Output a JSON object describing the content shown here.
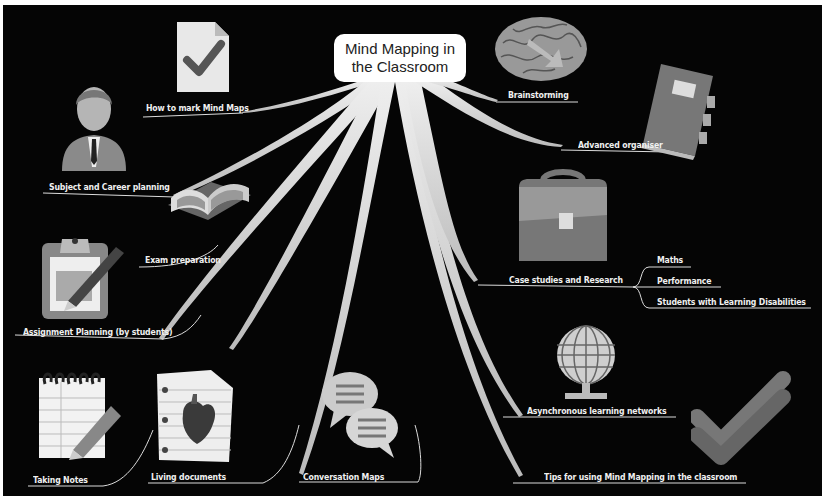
{
  "central_topic": {
    "line1": "Mind Mapping in",
    "line2": "the Classroom"
  },
  "branches": [
    {
      "id": "how-to-mark",
      "label": "How to mark Mind Maps",
      "icon": "checked-document-icon"
    },
    {
      "id": "subject-career",
      "label": "Subject and Career planning",
      "icon": "businessman-icon"
    },
    {
      "id": "exam-prep",
      "label": "Exam preparation",
      "icon": "open-book-icon"
    },
    {
      "id": "assignment-planning",
      "label": "Assignment Planning (by students)",
      "icon": "clipboard-pen-icon"
    },
    {
      "id": "taking-notes",
      "label": "Taking Notes",
      "icon": "notepad-pencil-icon"
    },
    {
      "id": "living-documents",
      "label": "Living documents",
      "icon": "heart-document-icon"
    },
    {
      "id": "conversation-maps",
      "label": "Conversation Maps",
      "icon": "speech-bubbles-icon"
    },
    {
      "id": "tips",
      "label": "Tips for using Mind Mapping in the classroom",
      "icon": "double-check-icon"
    },
    {
      "id": "async-networks",
      "label": "Asynchronous learning networks",
      "icon": "network-globe-icon"
    },
    {
      "id": "case-studies",
      "label": "Case studies and Research",
      "icon": "briefcase-icon",
      "children": [
        "Maths",
        "Performance",
        "Students with Learning Disabilities"
      ]
    },
    {
      "id": "advanced-organiser",
      "label": "Advanced organiser",
      "icon": "binder-book-icon"
    },
    {
      "id": "brainstorming",
      "label": "Brainstorming",
      "icon": "brain-icon"
    }
  ],
  "colors": {
    "background": "#050505",
    "branch": "#d8d8d8",
    "text": "#f0f0f0",
    "central_bg": "#ffffff"
  }
}
